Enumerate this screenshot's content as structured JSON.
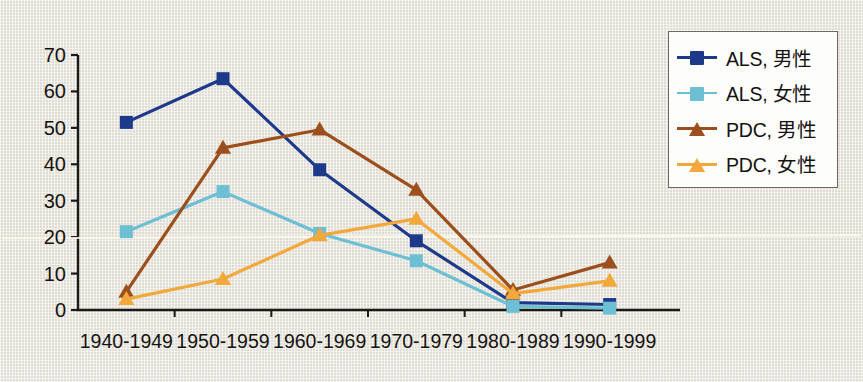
{
  "chart_data": {
    "type": "line",
    "title": "",
    "subtitle": "",
    "xlabel": "",
    "ylabel": "",
    "categories": [
      "1940-1949",
      "1950-1959",
      "1960-1969",
      "1970-1979",
      "1980-1989",
      "1990-1999"
    ],
    "ylim": [
      0,
      70
    ],
    "yticks": [
      0,
      10,
      20,
      30,
      40,
      50,
      60,
      70
    ],
    "grid": false,
    "legend_position": "upper-right",
    "series": [
      {
        "name": "ALS, 男性",
        "color": "#1d3a8a",
        "marker": "square",
        "values": [
          51.5,
          63.5,
          38.5,
          19.0,
          2.0,
          1.5
        ]
      },
      {
        "name": "ALS, 女性",
        "color": "#6dbfd4",
        "marker": "square",
        "values": [
          21.5,
          32.5,
          21.0,
          13.5,
          1.0,
          0.5
        ]
      },
      {
        "name": "PDC, 男性",
        "color": "#9c4f1c",
        "marker": "triangle",
        "values": [
          5.0,
          44.5,
          49.5,
          33.0,
          5.5,
          13.0
        ]
      },
      {
        "name": "PDC, 女性",
        "color": "#f2a83b",
        "marker": "triangle",
        "values": [
          3.0,
          8.5,
          20.5,
          25.0,
          4.5,
          8.0
        ]
      }
    ]
  },
  "legend": {
    "items": [
      {
        "label": "ALS, 男性",
        "color": "#1d3a8a",
        "marker": "square"
      },
      {
        "label": "ALS, 女性",
        "color": "#6dbfd4",
        "marker": "square"
      },
      {
        "label": "PDC, 男性",
        "color": "#9c4f1c",
        "marker": "triangle"
      },
      {
        "label": "PDC, 女性",
        "color": "#f2a83b",
        "marker": "triangle"
      }
    ]
  },
  "axis": {
    "y_tick_labels": [
      "70",
      "60",
      "50",
      "40",
      "30",
      "20",
      "10",
      "0"
    ],
    "x_tick_labels": [
      "1940-1949",
      "1950-1959",
      "1960-1969",
      "1970-1979",
      "1980-1989",
      "1990-1999"
    ]
  }
}
